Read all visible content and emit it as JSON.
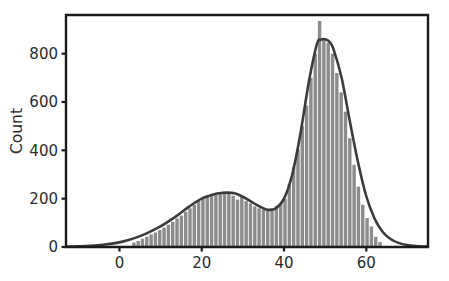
{
  "figure": {
    "background_color": "#ffffff",
    "plot_area": {
      "left": 66,
      "top": 15,
      "right": 428,
      "bottom": 247
    }
  },
  "style": {
    "bar_color": "#8c8c8c",
    "bar_gap_color": "#ffffff",
    "curve_color": "#3b3b3b",
    "frame_color": "#1a1a1a",
    "text_color": "#2b2b2b"
  },
  "chart_data": {
    "type": "bar",
    "subtype": "histogram-with-kde",
    "title": "",
    "subtitle": "",
    "xlabel": "",
    "ylabel": "Count",
    "xlim": [
      -13,
      75
    ],
    "ylim": [
      0,
      960
    ],
    "xticks": [
      0,
      20,
      40,
      60
    ],
    "xtick_labels": [
      "0",
      "20",
      "40",
      "60"
    ],
    "yticks": [
      0,
      200,
      400,
      600,
      800
    ],
    "ytick_labels": [
      "0",
      "200",
      "400",
      "600",
      "800"
    ],
    "grid": false,
    "legend": null,
    "legend_position": "none",
    "annotations": [],
    "bin_width": 1.05,
    "bin_centers": [
      3.6,
      4.65,
      5.7,
      6.75,
      7.8,
      8.85,
      9.9,
      10.95,
      12.0,
      13.05,
      14.1,
      15.15,
      16.2,
      17.25,
      18.3,
      19.35,
      20.4,
      21.45,
      22.5,
      23.55,
      24.6,
      25.65,
      26.7,
      27.75,
      28.8,
      29.85,
      30.9,
      31.95,
      33.0,
      34.05,
      35.1,
      36.15,
      37.2,
      38.25,
      39.3,
      40.35,
      41.4,
      42.45,
      43.5,
      44.55,
      45.6,
      46.65,
      47.7,
      48.75,
      49.8,
      50.85,
      51.9,
      52.95,
      54.0,
      55.05,
      56.1,
      57.15,
      58.2,
      59.25,
      60.3,
      61.35,
      62.4,
      63.45
    ],
    "counts": [
      18,
      25,
      34,
      42,
      52,
      60,
      70,
      80,
      92,
      104,
      118,
      130,
      146,
      160,
      175,
      190,
      200,
      212,
      218,
      215,
      222,
      225,
      228,
      212,
      196,
      210,
      190,
      180,
      168,
      160,
      155,
      150,
      158,
      170,
      182,
      200,
      262,
      330,
      405,
      500,
      585,
      700,
      800,
      935,
      860,
      845,
      800,
      720,
      640,
      560,
      450,
      340,
      250,
      175,
      120,
      85,
      42,
      20
    ],
    "series": [
      {
        "name": "Histogram",
        "type": "bar",
        "color": "#8c8c8c",
        "values": [
          18,
          25,
          34,
          42,
          52,
          60,
          70,
          80,
          92,
          104,
          118,
          130,
          146,
          160,
          175,
          190,
          200,
          212,
          218,
          215,
          222,
          225,
          228,
          212,
          196,
          210,
          190,
          180,
          168,
          160,
          155,
          150,
          158,
          170,
          182,
          200,
          262,
          330,
          405,
          500,
          585,
          700,
          800,
          935,
          860,
          845,
          800,
          720,
          640,
          560,
          450,
          340,
          250,
          175,
          120,
          85,
          42,
          20
        ]
      },
      {
        "name": "Density curve",
        "type": "line",
        "color": "#3b3b3b",
        "x": [
          -13,
          -10,
          -7,
          -4,
          -1,
          2,
          5,
          8,
          11,
          14,
          17,
          20,
          23,
          25,
          26,
          28,
          30,
          32,
          34,
          36,
          38,
          40,
          42,
          44,
          46,
          48,
          49,
          50,
          51,
          52,
          54,
          56,
          58,
          60,
          62,
          64,
          66,
          68,
          70,
          72,
          75
        ],
        "y": [
          2,
          3,
          5,
          9,
          16,
          28,
          45,
          68,
          96,
          130,
          168,
          200,
          218,
          224,
          225,
          222,
          208,
          188,
          168,
          154,
          160,
          200,
          300,
          470,
          680,
          840,
          858,
          860,
          850,
          820,
          700,
          520,
          350,
          210,
          118,
          62,
          32,
          16,
          8,
          4,
          2
        ]
      }
    ],
    "peaks": [
      {
        "label": "secondary mode",
        "x": 26,
        "y": 225
      },
      {
        "label": "valley",
        "x": 36,
        "y": 150
      },
      {
        "label": "primary mode",
        "x": 48.75,
        "y": 935
      }
    ]
  }
}
